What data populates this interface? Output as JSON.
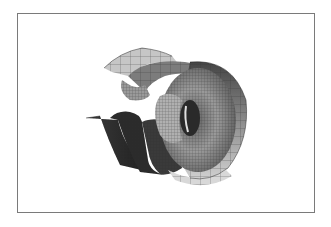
{
  "figure": {
    "type": "3d-surface-render",
    "frame_color": "#7a7a7a",
    "background": "#ffffff",
    "palette": {
      "light": "#d4d4d4",
      "mid": "#9a9a9a",
      "dark": "#555555",
      "darkest": "#2e2e2e",
      "mesh_line": "#333333"
    }
  }
}
